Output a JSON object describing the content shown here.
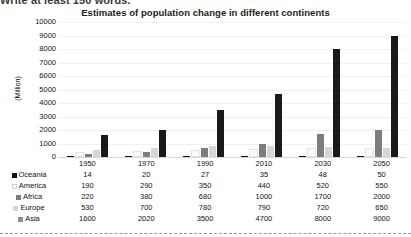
{
  "page": {
    "cutoff_instruction": "Write at least 150 words."
  },
  "chart_data": {
    "type": "bar",
    "title": "Estimates of population change in different continents",
    "xlabel": "",
    "ylabel": "(Million)",
    "ylim": [
      0,
      10000
    ],
    "ytick_labels": [
      "10000",
      "9000",
      "8000",
      "7000",
      "6000",
      "5000",
      "4000",
      "3000",
      "2000",
      "1000",
      "0"
    ],
    "ytick_values": [
      10000,
      9000,
      8000,
      7000,
      6000,
      5000,
      4000,
      3000,
      2000,
      1000,
      0
    ],
    "grid": true,
    "legend_position": "table-left",
    "categories": [
      "1950",
      "1970",
      "1990",
      "2010",
      "2030",
      "2050"
    ],
    "series": [
      {
        "name": "Oceania",
        "color": "#111111",
        "values": [
          14,
          20,
          27,
          35,
          48,
          50
        ]
      },
      {
        "name": "America",
        "color": "#fbfbfb",
        "values": [
          190,
          290,
          350,
          440,
          520,
          550
        ]
      },
      {
        "name": "Africa",
        "color": "#7d7d7d",
        "values": [
          220,
          380,
          680,
          1000,
          1700,
          2000
        ]
      },
      {
        "name": "Europe",
        "color": "#d6d6d6",
        "values": [
          530,
          700,
          780,
          790,
          720,
          650
        ]
      },
      {
        "name": "Asia",
        "color": "#1a1a1a",
        "values": [
          1600,
          2020,
          3500,
          4700,
          8000,
          9000
        ]
      }
    ]
  },
  "table": {
    "year_header_blank": "",
    "years": [
      "1950",
      "1970",
      "1990",
      "2010",
      "2030",
      "2050"
    ],
    "rows": [
      {
        "label": "Oceania",
        "swatch": "#111111",
        "outlined": false,
        "values": [
          "14",
          "20",
          "27",
          "35",
          "48",
          "50"
        ]
      },
      {
        "label": "America",
        "swatch": "#ffffff",
        "outlined": true,
        "values": [
          "190",
          "290",
          "350",
          "440",
          "520",
          "550"
        ]
      },
      {
        "label": "Africa",
        "swatch": "#7d7d7d",
        "outlined": false,
        "values": [
          "220",
          "380",
          "680",
          "1000",
          "1700",
          "2000"
        ]
      },
      {
        "label": "Europe",
        "swatch": "#d6d6d6",
        "outlined": false,
        "values": [
          "530",
          "700",
          "780",
          "790",
          "720",
          "650"
        ]
      },
      {
        "label": "Asia",
        "swatch": "#8f8f8f",
        "outlined": false,
        "values": [
          "1600",
          "2020",
          "3500",
          "4700",
          "8000",
          "9000"
        ]
      }
    ]
  }
}
